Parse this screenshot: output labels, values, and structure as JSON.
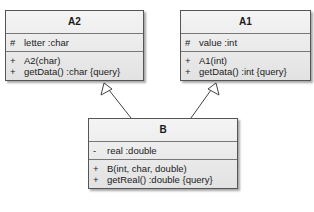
{
  "classes": {
    "A2": {
      "name": "A2",
      "attributes": [
        {
          "vis": "#",
          "text": "letter  :char"
        }
      ],
      "operations": [
        {
          "vis": "+",
          "text": "A2(char)"
        },
        {
          "vis": "+",
          "text": "getData()  :char {query}"
        }
      ]
    },
    "A1": {
      "name": "A1",
      "attributes": [
        {
          "vis": "#",
          "text": "value  :int"
        }
      ],
      "operations": [
        {
          "vis": "+",
          "text": "A1(int)"
        },
        {
          "vis": "+",
          "text": "getData()  :int {query}"
        }
      ]
    },
    "B": {
      "name": "B",
      "attributes": [
        {
          "vis": "-",
          "text": "real  :double"
        }
      ],
      "operations": [
        {
          "vis": "+",
          "text": "B(int, char, double)"
        },
        {
          "vis": "+",
          "text": "getReal()  :double {query}"
        }
      ]
    }
  },
  "relations": [
    {
      "type": "generalization",
      "from": "B",
      "to": "A2"
    },
    {
      "type": "generalization",
      "from": "B",
      "to": "A1"
    }
  ]
}
